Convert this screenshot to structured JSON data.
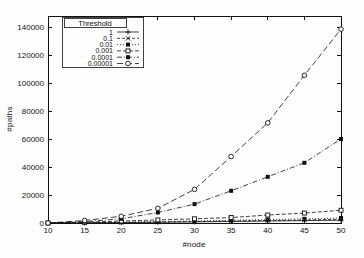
{
  "window": {
    "background": "#fdfdfd",
    "foreground": "#111111"
  },
  "chart_data": {
    "type": "line",
    "title": "",
    "xlabel": "#node",
    "ylabel": "#paths",
    "x": [
      10,
      15,
      20,
      25,
      30,
      35,
      40,
      45,
      50
    ],
    "x_ticks": [
      "10",
      "15",
      "20",
      "25",
      "30",
      "35",
      "40",
      "45",
      "50"
    ],
    "y_ticks": [
      "0",
      "20000",
      "40000",
      "60000",
      "80000",
      "100000",
      "120000",
      "140000"
    ],
    "y_tick_values": [
      0,
      20000,
      40000,
      60000,
      80000,
      100000,
      120000,
      140000
    ],
    "xlim": [
      10,
      50
    ],
    "ylim": [
      0,
      148000
    ],
    "grid": false,
    "line_color": "#111111",
    "legend": {
      "title": "Threshold",
      "position": "top-left",
      "boxed": true
    },
    "series": [
      {
        "name": "1",
        "marker": "plus",
        "dash": "solid",
        "values": [
          0,
          100,
          300,
          500,
          800,
          1100,
          1400,
          1700,
          2000
        ]
      },
      {
        "name": "0.1",
        "marker": "cross",
        "dash": "dash-dot2",
        "values": [
          0,
          150,
          400,
          700,
          1000,
          1400,
          1800,
          2200,
          2700
        ]
      },
      {
        "name": "0.01",
        "marker": "filled-square",
        "dash": "dot",
        "values": [
          0,
          250,
          600,
          1000,
          1500,
          2000,
          2500,
          3000,
          3600
        ]
      },
      {
        "name": "0.001",
        "marker": "open-square",
        "dash": "dash-short",
        "values": [
          0,
          600,
          1400,
          2200,
          3000,
          3900,
          5700,
          7100,
          9100
        ]
      },
      {
        "name": "0.0001",
        "marker": "filled-square",
        "dash": "dash-dot",
        "values": [
          0,
          1000,
          3000,
          7500,
          13500,
          23000,
          33000,
          43000,
          60000
        ]
      },
      {
        "name": "0.00001",
        "marker": "open-circle",
        "dash": "dash-long",
        "values": [
          0,
          1800,
          4800,
          10500,
          24000,
          47500,
          71500,
          105500,
          138500
        ]
      }
    ]
  }
}
